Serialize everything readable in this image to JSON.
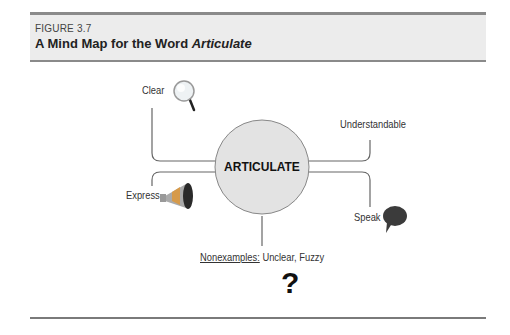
{
  "figure": {
    "label": "FIGURE 3.7",
    "title_prefix": "A Mind Map for the Word ",
    "title_word": "Articulate"
  },
  "mind_map": {
    "center": "ARTICULATE",
    "branches": [
      {
        "label": "Clear",
        "icon": "magnifying-glass-icon",
        "position": "top-left"
      },
      {
        "label": "Understandable",
        "icon": null,
        "position": "top-right"
      },
      {
        "label": "Express",
        "icon": "megaphone-icon",
        "position": "bottom-left"
      },
      {
        "label": "Speak",
        "icon": "speech-bubble-icon",
        "position": "bottom-right"
      }
    ],
    "nonexamples": {
      "heading": "Nonexamples:",
      "text": " Unclear, Fuzzy",
      "icon": "question-mark-icon",
      "icon_glyph": "?"
    }
  },
  "colors": {
    "header_bg": "#ececec",
    "rule": "#8a8a8a",
    "circle_fill": "#e3e3e3",
    "line": "#666666"
  }
}
